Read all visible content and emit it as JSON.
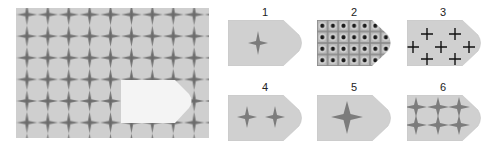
{
  "puzzle": {
    "main_panel": {
      "pattern": "four-point-star-grid",
      "background_color": "#cfcfcf",
      "star_color": "#7a7a7a",
      "missing_piece_color": "#f4f4f4"
    },
    "options": [
      {
        "label": "1",
        "pattern": "single-small-star"
      },
      {
        "label": "2",
        "pattern": "dotted-grid"
      },
      {
        "label": "3",
        "pattern": "plus-signs"
      },
      {
        "label": "4",
        "pattern": "two-small-stars"
      },
      {
        "label": "5",
        "pattern": "single-large-star"
      },
      {
        "label": "6",
        "pattern": "star-grid-3x2"
      }
    ],
    "colors": {
      "shape_fill": "#d0d0d0",
      "shape_edge": "#bdbdbd",
      "star": "#7c7c7c",
      "plus": "#111111",
      "dot": "#1a1a1a",
      "grid_line": "#8a8a8a"
    }
  }
}
